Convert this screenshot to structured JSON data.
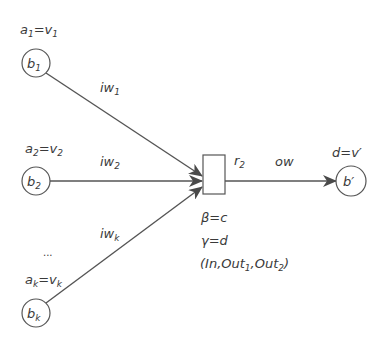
{
  "diagram": {
    "inputs": [
      {
        "node": "b",
        "node_sub": "1",
        "assign_a": "a",
        "assign_a_sub": "1",
        "assign_v": "v",
        "assign_v_sub": "1",
        "weight": "iw",
        "weight_sub": "1"
      },
      {
        "node": "b",
        "node_sub": "2",
        "assign_a": "a",
        "assign_a_sub": "2",
        "assign_v": "v",
        "assign_v_sub": "2",
        "weight": "iw",
        "weight_sub": "2"
      },
      {
        "node": "b",
        "node_sub": "k",
        "assign_a": "a",
        "assign_a_sub": "k",
        "assign_v": "v",
        "assign_v_sub": "k",
        "weight": "iw",
        "weight_sub": "k"
      }
    ],
    "ellipsis": "...",
    "eq": "=",
    "rule": {
      "label": "r",
      "label_sub": "2",
      "beta": "β=c",
      "gamma": "γ=d",
      "signature_open": "(In,Out",
      "sub1": "1",
      "sep": ",Out",
      "sub2": "2",
      "signature_close": ")"
    },
    "output": {
      "weight": "ow",
      "node": "b′",
      "assign": "d=v′"
    },
    "colors": {
      "stroke": "#4a4a4a",
      "text": "#3a3a3a"
    }
  }
}
